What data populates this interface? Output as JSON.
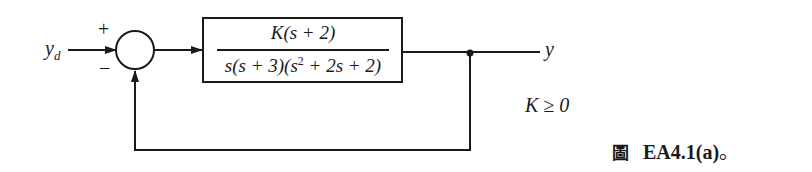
{
  "diagram": {
    "type": "feedback-block-diagram",
    "input_label": "y",
    "input_subscript": "d",
    "output_label": "y",
    "summing_junction": {
      "plus_sign": "+",
      "minus_sign": "−"
    },
    "plant": {
      "numerator": "K(s + 2)",
      "denominator_pre": "s(s + 3)(s",
      "denominator_exp": "2",
      "denominator_post": " + 2s + 2)"
    },
    "constraint": "K ≥ 0",
    "feedback": "unity negative feedback"
  },
  "caption": {
    "prefix": "圖",
    "label": "EA4.1(a)",
    "suffix": "。"
  },
  "colors": {
    "line": "#1a1a1a",
    "background": "#ffffff"
  }
}
